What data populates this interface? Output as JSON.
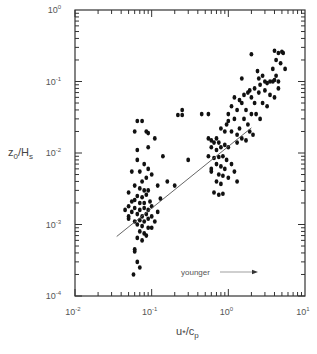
{
  "chart_data": {
    "type": "scatter",
    "title": "",
    "xlabel": "u*/cp",
    "ylabel": "z0/Hs",
    "xscale": "log",
    "yscale": "log",
    "xlim": [
      0.01,
      10
    ],
    "ylim": [
      0.0001,
      1
    ],
    "grid": false,
    "x_ticks": [
      {
        "base": "10",
        "exp": "-2",
        "value": 0.01
      },
      {
        "base": "10",
        "exp": "-1",
        "value": 0.1
      },
      {
        "base": "10",
        "exp": "0",
        "value": 1
      },
      {
        "base": "10",
        "exp": "1",
        "value": 10
      }
    ],
    "y_ticks": [
      {
        "base": "10",
        "exp": "-4",
        "value": 0.0001
      },
      {
        "base": "10",
        "exp": "-3",
        "value": 0.001
      },
      {
        "base": "10",
        "exp": "-2",
        "value": 0.01
      },
      {
        "base": "10",
        "exp": "-1",
        "value": 0.1
      },
      {
        "base": "10",
        "exp": "0",
        "value": 1
      }
    ],
    "annotations": [
      {
        "text": "younger",
        "arrow": "right",
        "x": 0.6,
        "y": 0.00025
      }
    ],
    "fit_line": {
      "x": [
        0.035,
        2.0
      ],
      "y": [
        0.00068,
        0.0225
      ]
    },
    "series": [
      {
        "name": "observations",
        "points": [
          [
            0.065,
            0.028
          ],
          [
            0.075,
            0.028
          ],
          [
            0.06,
            0.02
          ],
          [
            0.085,
            0.02
          ],
          [
            0.09,
            0.019
          ],
          [
            0.065,
            0.011
          ],
          [
            0.09,
            0.012
          ],
          [
            0.11,
            0.016
          ],
          [
            0.14,
            0.009
          ],
          [
            0.065,
            0.008
          ],
          [
            0.08,
            0.007
          ],
          [
            0.09,
            0.006
          ],
          [
            0.055,
            0.0055
          ],
          [
            0.07,
            0.0055
          ],
          [
            0.085,
            0.0045
          ],
          [
            0.1,
            0.005
          ],
          [
            0.075,
            0.004
          ],
          [
            0.06,
            0.0035
          ],
          [
            0.07,
            0.0032
          ],
          [
            0.08,
            0.003
          ],
          [
            0.09,
            0.003
          ],
          [
            0.12,
            0.0035
          ],
          [
            0.065,
            0.0025
          ],
          [
            0.075,
            0.0024
          ],
          [
            0.05,
            0.0028
          ],
          [
            0.085,
            0.0026
          ],
          [
            0.06,
            0.0022
          ],
          [
            0.07,
            0.002
          ],
          [
            0.08,
            0.002
          ],
          [
            0.095,
            0.0021
          ],
          [
            0.05,
            0.0018
          ],
          [
            0.06,
            0.0017
          ],
          [
            0.07,
            0.0016
          ],
          [
            0.08,
            0.0017
          ],
          [
            0.09,
            0.0016
          ],
          [
            0.1,
            0.0018
          ],
          [
            0.055,
            0.0015
          ],
          [
            0.065,
            0.0014
          ],
          [
            0.075,
            0.0013
          ],
          [
            0.085,
            0.0014
          ],
          [
            0.1,
            0.0013
          ],
          [
            0.12,
            0.0015
          ],
          [
            0.05,
            0.0012
          ],
          [
            0.06,
            0.0011
          ],
          [
            0.07,
            0.00115
          ],
          [
            0.08,
            0.0011
          ],
          [
            0.09,
            0.0012
          ],
          [
            0.11,
            0.0011
          ],
          [
            0.065,
            0.001
          ],
          [
            0.075,
            0.00095
          ],
          [
            0.07,
            0.0008
          ],
          [
            0.08,
            0.00075
          ],
          [
            0.085,
            0.0007
          ],
          [
            0.065,
            0.00065
          ],
          [
            0.075,
            0.0006
          ],
          [
            0.06,
            0.00045
          ],
          [
            0.06,
            0.00042
          ],
          [
            0.065,
            0.0003
          ],
          [
            0.07,
            0.00025
          ],
          [
            0.058,
            0.0002
          ],
          [
            0.045,
            0.0016
          ],
          [
            0.05,
            0.0013
          ],
          [
            0.055,
            0.0021
          ],
          [
            0.09,
            0.0009
          ],
          [
            0.1,
            0.0009
          ],
          [
            0.16,
            0.004
          ],
          [
            0.13,
            0.0023
          ],
          [
            0.2,
            0.0035
          ],
          [
            0.22,
            0.034
          ],
          [
            0.25,
            0.034
          ],
          [
            0.25,
            0.04
          ],
          [
            0.3,
            0.008
          ],
          [
            0.45,
            0.035
          ],
          [
            0.55,
            0.035
          ],
          [
            0.55,
            0.016
          ],
          [
            0.6,
            0.015
          ],
          [
            0.65,
            0.014
          ],
          [
            0.7,
            0.016
          ],
          [
            0.75,
            0.014
          ],
          [
            0.6,
            0.012
          ],
          [
            0.7,
            0.011
          ],
          [
            0.8,
            0.012
          ],
          [
            0.9,
            0.013
          ],
          [
            1.0,
            0.012
          ],
          [
            0.55,
            0.009
          ],
          [
            0.65,
            0.0085
          ],
          [
            0.75,
            0.0088
          ],
          [
            0.85,
            0.009
          ],
          [
            0.95,
            0.008
          ],
          [
            0.7,
            0.007
          ],
          [
            0.8,
            0.0065
          ],
          [
            0.9,
            0.006
          ],
          [
            1.1,
            0.007
          ],
          [
            0.6,
            0.0055
          ],
          [
            0.75,
            0.005
          ],
          [
            0.85,
            0.0048
          ],
          [
            1.0,
            0.0045
          ],
          [
            1.2,
            0.0055
          ],
          [
            1.3,
            0.004
          ],
          [
            0.7,
            0.004
          ],
          [
            0.8,
            0.0037
          ],
          [
            0.65,
            0.0028
          ],
          [
            0.75,
            0.0026
          ],
          [
            0.85,
            0.0027
          ],
          [
            0.6,
            0.006
          ],
          [
            0.95,
            0.025
          ],
          [
            1.0,
            0.028
          ],
          [
            1.2,
            0.03
          ],
          [
            1.4,
            0.022
          ],
          [
            1.1,
            0.02
          ],
          [
            1.3,
            0.018
          ],
          [
            1.5,
            0.016
          ],
          [
            1.7,
            0.015
          ],
          [
            1.3,
            0.014
          ],
          [
            0.8,
            0.022
          ],
          [
            0.9,
            0.02
          ],
          [
            1.6,
            0.03
          ],
          [
            1.8,
            0.025
          ],
          [
            2.0,
            0.035
          ],
          [
            1.1,
            0.045
          ],
          [
            1.3,
            0.04
          ],
          [
            1.5,
            0.05
          ],
          [
            1.7,
            0.04
          ],
          [
            2.2,
            0.05
          ],
          [
            1.2,
            0.06
          ],
          [
            1.4,
            0.055
          ],
          [
            2.0,
            0.06
          ],
          [
            2.5,
            0.07
          ],
          [
            1.6,
            0.065
          ],
          [
            1.8,
            0.07
          ],
          [
            2.2,
            0.08
          ],
          [
            2.6,
            0.09
          ],
          [
            3.0,
            0.1
          ],
          [
            3.2,
            0.095
          ],
          [
            3.5,
            0.1
          ],
          [
            3.8,
            0.1
          ],
          [
            4.0,
            0.105
          ],
          [
            2.5,
            0.11
          ],
          [
            3.0,
            0.075
          ],
          [
            3.5,
            0.065
          ],
          [
            4.0,
            0.06
          ],
          [
            2.8,
            0.05
          ],
          [
            3.2,
            0.045
          ],
          [
            4.5,
            0.08
          ],
          [
            3.8,
            0.15
          ],
          [
            4.2,
            0.2
          ],
          [
            4.5,
            0.25
          ],
          [
            5.0,
            0.26
          ],
          [
            5.2,
            0.25
          ],
          [
            4.0,
            0.27
          ],
          [
            4.8,
            0.18
          ],
          [
            5.5,
            0.15
          ],
          [
            4.2,
            0.12
          ],
          [
            4.5,
            0.1
          ],
          [
            2.0,
            0.24
          ],
          [
            1.9,
            0.075
          ],
          [
            2.4,
            0.14
          ],
          [
            2.8,
            0.12
          ],
          [
            1.5,
            0.11
          ],
          [
            2.3,
            0.035
          ],
          [
            2.6,
            0.03
          ],
          [
            1.9,
            0.02
          ],
          [
            2.1,
            0.018
          ],
          [
            1.0,
            0.035
          ]
        ]
      }
    ]
  },
  "axes": {
    "xlabel_main": "u",
    "xlabel_star": "*",
    "xlabel_div": "/c",
    "xlabel_sub": "p",
    "ylabel_main": "z",
    "ylabel_sub0": "0",
    "ylabel_div": "/H",
    "ylabel_sub1": "s"
  },
  "annotation": {
    "text": "younger"
  },
  "colors": {
    "axis": "#333333",
    "point": "#111111",
    "line": "#555555",
    "text": "#555555"
  }
}
